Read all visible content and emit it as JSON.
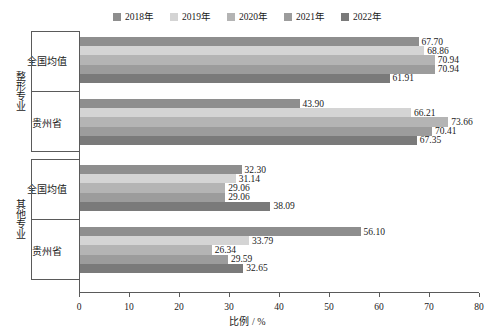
{
  "chart_data": {
    "type": "bar",
    "orientation": "horizontal",
    "title": "",
    "xlabel": "比例 / %",
    "ylabel": "",
    "xlim": [
      0,
      80
    ],
    "xticks": [
      0,
      10,
      20,
      30,
      40,
      50,
      60,
      70,
      80
    ],
    "grid": false,
    "legend_position": "top-center",
    "legend": [
      "2018年",
      "2019年",
      "2020年",
      "2021年",
      "2022年"
    ],
    "series_colors": [
      "#8e8e8e",
      "#d4d4d4",
      "#b4b4b4",
      "#9c9c9c",
      "#7a7a7a"
    ],
    "groups": [
      {
        "label": "整形专业",
        "categories": [
          {
            "label": "全国均值",
            "values": [
              67.7,
              68.86,
              70.94,
              70.94,
              61.91
            ],
            "value_labels": [
              "67.70",
              "68.86",
              "70.94",
              "70.94",
              "61.91"
            ]
          },
          {
            "label": "贵州省",
            "values": [
              43.9,
              66.21,
              73.66,
              70.41,
              67.35
            ],
            "value_labels": [
              "43.90",
              "66.21",
              "73.66",
              "70.41",
              "67.35"
            ]
          }
        ]
      },
      {
        "label": "其他专业",
        "categories": [
          {
            "label": "全国均值",
            "values": [
              32.3,
              31.14,
              29.06,
              29.06,
              38.09
            ],
            "value_labels": [
              "32.30",
              "31.14",
              "29.06",
              "29.06",
              "38.09"
            ]
          },
          {
            "label": "贵州省",
            "values": [
              56.1,
              33.79,
              26.34,
              29.59,
              32.65
            ],
            "value_labels": [
              "56.10",
              "33.79",
              "26.34",
              "29.59",
              "32.65"
            ]
          }
        ]
      }
    ]
  }
}
